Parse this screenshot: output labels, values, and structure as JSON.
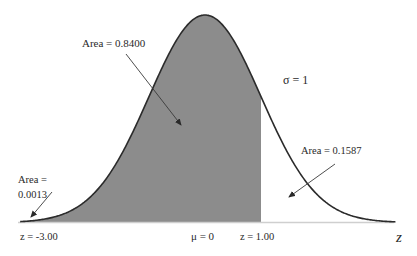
{
  "chart_data": {
    "type": "area",
    "title": "",
    "distribution": "Standard normal distribution",
    "mean": 0,
    "std_dev": 1,
    "xlabel": "z",
    "ylabel": "",
    "xlim": [
      -3.3,
      3.4
    ],
    "shaded_region": {
      "from": "-inf",
      "to": 1.0,
      "color": "#8c8c8c"
    },
    "annotations": [
      {
        "text": "Area = 0.8400",
        "target": "shaded region (-3.00 to 1.00)"
      },
      {
        "text": "Area = 0.0013",
        "target": "left tail below z = -3.00"
      },
      {
        "text": "Area = 0.1587",
        "target": "right tail above z = 1.00"
      },
      {
        "text": "σ = 1"
      }
    ],
    "tick_labels": [
      "z = -3.00",
      "μ = 0",
      "z = 1.00"
    ],
    "grid": false,
    "legend": "none"
  },
  "labels": {
    "area_main": "Area = 0.8400",
    "area_left_line1": "Area =",
    "area_left_line2": "0.0013",
    "area_right": "Area = 0.1587",
    "sigma": "σ = 1",
    "tick_left": "z = -3.00",
    "tick_mean": "μ = 0",
    "tick_right": "z = 1.00",
    "axis_z": "z"
  },
  "colors": {
    "shade": "#8c8c8c",
    "curve": "#2b2b2b",
    "baseline": "#cfcfcf",
    "text": "#2a2a2a"
  }
}
